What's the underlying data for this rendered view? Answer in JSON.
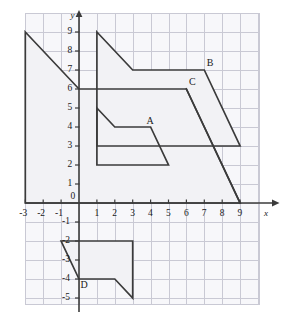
{
  "figure": {
    "background_color": "#ffffff",
    "grid_color": "#c9c9d4",
    "grid_fill_color": "#f7f7fa",
    "axis_color": "#3b3b3b",
    "shape_stroke_color": "#3b3b3b",
    "shape_fill_color": "#f2f2f5"
  },
  "axes": {
    "x_axis_label": "x",
    "y_axis_label": "y",
    "origin_label": "0",
    "x_range": [
      -3,
      9
    ],
    "y_range": [
      -5,
      9
    ],
    "x_tick_labels": [
      "-3",
      "-2",
      "-1",
      "1",
      "2",
      "3",
      "4",
      "5",
      "6",
      "7",
      "8",
      "9"
    ],
    "x_tick_values": [
      -3,
      -2,
      -1,
      1,
      2,
      3,
      4,
      5,
      6,
      7,
      8,
      9
    ],
    "y_tick_labels": [
      "9",
      "8",
      "7",
      "6",
      "5",
      "4",
      "3",
      "2",
      "1",
      "-1",
      "-2",
      "-3",
      "-4",
      "-5"
    ],
    "y_tick_values": [
      9,
      8,
      7,
      6,
      5,
      4,
      3,
      2,
      1,
      -1,
      -2,
      -3,
      -4,
      -5
    ],
    "grid_x_min": -3,
    "grid_x_max": 10,
    "grid_y_min": -5,
    "grid_y_max": 9
  },
  "chart_data": {
    "type": "scatter",
    "xlabel": "x",
    "ylabel": "y",
    "xlim": [
      -3,
      10
    ],
    "ylim": [
      -5,
      9
    ],
    "grid": true,
    "legend": "none",
    "shapes": [
      {
        "name": "big-shape",
        "label": "",
        "label_point": [
          null,
          null
        ],
        "closed": true,
        "points": [
          [
            -3,
            9
          ],
          [
            0,
            6
          ],
          [
            6,
            6
          ],
          [
            9,
            0
          ],
          [
            -3,
            0
          ]
        ]
      },
      {
        "name": "shape-b",
        "label": "B",
        "label_point": [
          7,
          7
        ],
        "closed": true,
        "points": [
          [
            1,
            9
          ],
          [
            3,
            7
          ],
          [
            7,
            7
          ],
          [
            9,
            3
          ],
          [
            1,
            3
          ]
        ]
      },
      {
        "name": "shape-a",
        "label": "A",
        "label_point": [
          4,
          4
        ],
        "closed": true,
        "points": [
          [
            1,
            5
          ],
          [
            2,
            4
          ],
          [
            4,
            4
          ],
          [
            5,
            2
          ],
          [
            1,
            2
          ]
        ]
      },
      {
        "name": "shape-c",
        "label": "C",
        "label_point": [
          6,
          6
        ],
        "closed": false,
        "points": [
          [
            6,
            6
          ],
          [
            9,
            0
          ]
        ]
      },
      {
        "name": "shape-d",
        "label": "D",
        "label_point": [
          0,
          -4
        ],
        "closed": true,
        "points": [
          [
            -1,
            -2
          ],
          [
            3,
            -2
          ],
          [
            3,
            -5
          ],
          [
            2,
            -4
          ],
          [
            0,
            -4
          ]
        ]
      }
    ]
  },
  "labels": {
    "shape_a": "A",
    "shape_b": "B",
    "shape_c": "C",
    "shape_d": "D",
    "x_axis": "x",
    "y_axis": "y",
    "origin": "0",
    "x_m3": "-3",
    "x_m2": "-2",
    "x_m1": "-1",
    "x_1": "1",
    "x_2": "2",
    "x_3": "3",
    "x_4": "4",
    "x_5": "5",
    "x_6": "6",
    "x_7": "7",
    "x_8": "8",
    "x_9": "9",
    "y_9": "9",
    "y_8": "8",
    "y_7": "7",
    "y_6": "6",
    "y_5": "5",
    "y_4": "4",
    "y_3": "3",
    "y_2": "2",
    "y_1": "1",
    "y_m1": "-1",
    "y_m2": "-2",
    "y_m3": "-3",
    "y_m4": "-4",
    "y_m5": "-5"
  }
}
